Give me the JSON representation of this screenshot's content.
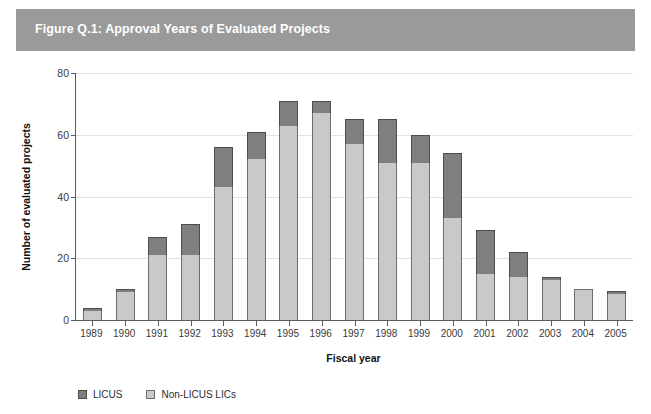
{
  "figure": {
    "title": "Figure Q.1: Approval Years of Evaluated Projects",
    "band_color": "#9a9a9a",
    "title_color": "#ffffff"
  },
  "chart_data": {
    "type": "bar",
    "stacked": true,
    "title": "Figure Q.1: Approval Years of Evaluated Projects",
    "xlabel": "Fiscal year",
    "ylabel": "Number of evaluated projects",
    "ylim": [
      0,
      80
    ],
    "yticks": [
      0,
      20,
      40,
      60,
      80
    ],
    "grid": true,
    "legend_position": "bottom-left",
    "categories": [
      "1989",
      "1990",
      "1991",
      "1992",
      "1993",
      "1994",
      "1995",
      "1996",
      "1997",
      "1998",
      "1999",
      "2000",
      "2001",
      "2002",
      "2003",
      "2004",
      "2005"
    ],
    "series": [
      {
        "name": "Non-LICUS LICs",
        "color": "#c9c9c9",
        "values": [
          3,
          9,
          21,
          21,
          43,
          52,
          63,
          67,
          57,
          51,
          51,
          33,
          15,
          14,
          13,
          10,
          8.5
        ]
      },
      {
        "name": "LICUS",
        "color": "#7f7f7f",
        "values": [
          1,
          1,
          6,
          10,
          13,
          9,
          8,
          4,
          8,
          14,
          9,
          21,
          14,
          8,
          0.5,
          0,
          0.5
        ]
      }
    ],
    "totals": [
      4,
      10,
      27,
      31,
      56,
      61,
      71,
      71,
      65,
      65,
      60,
      54,
      29,
      22,
      13.5,
      10,
      9
    ]
  },
  "axes": {
    "y_ticks": [
      "80",
      "60",
      "40",
      "20",
      "0"
    ],
    "y_title": "Number of evaluated projects",
    "x_title": "Fiscal year",
    "x_ticks": [
      "1989",
      "1990",
      "1991",
      "1992",
      "1993",
      "1994",
      "1995",
      "1996",
      "1997",
      "1998",
      "1999",
      "2000",
      "2001",
      "2002",
      "2003",
      "2004",
      "2005"
    ]
  },
  "legend": {
    "items": [
      {
        "label": "LICUS",
        "swatch": "dark"
      },
      {
        "label": "Non-LICUS LICs",
        "swatch": "light"
      }
    ]
  }
}
